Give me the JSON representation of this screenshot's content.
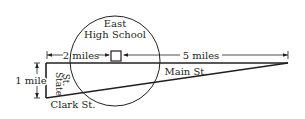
{
  "diagram": {
    "school_label_line1": "East",
    "school_label_line2": "High School",
    "dist_left_label": "2 miles",
    "dist_right_label": "5 miles",
    "height_label": "1 mile",
    "state_st_line1": "State",
    "state_st_line2": "St.",
    "main_st_label": "Main St.",
    "clark_st_label": "Clark St.",
    "stroke_color": "#231f20"
  }
}
